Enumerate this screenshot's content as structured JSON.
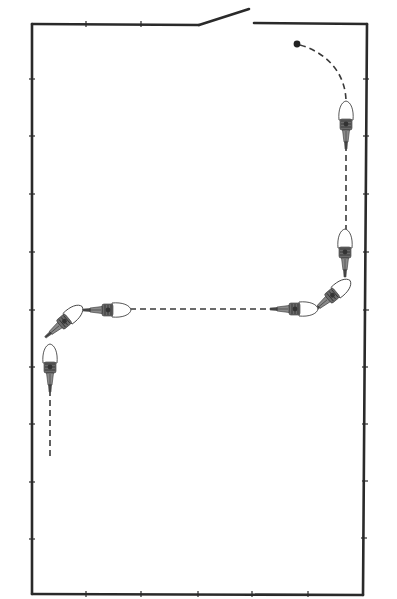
{
  "diagram": {
    "type": "riding-arena-pattern",
    "colors": {
      "background": "#ffffff",
      "line": "#2a2a2a",
      "track": "#3a3a3a"
    },
    "arena": {
      "shape": "rectangle",
      "gate": "top-edge, open gate near center"
    },
    "track": {
      "start_marker": "filled-dot",
      "segments": [
        "curve from start dot to right track",
        "straight down along right side",
        "quarter turn to the left",
        "straight across toward left side",
        "quarter turn downward",
        "straight down along left side"
      ]
    },
    "horses": [
      {
        "position": "right-top",
        "heading": "down"
      },
      {
        "position": "right-middle",
        "heading": "down"
      },
      {
        "position": "right-corner",
        "heading": "down-left"
      },
      {
        "position": "center-right",
        "heading": "left"
      },
      {
        "position": "center-left",
        "heading": "left"
      },
      {
        "position": "left-corner",
        "heading": "down-left"
      },
      {
        "position": "left-lower",
        "heading": "down"
      }
    ]
  }
}
